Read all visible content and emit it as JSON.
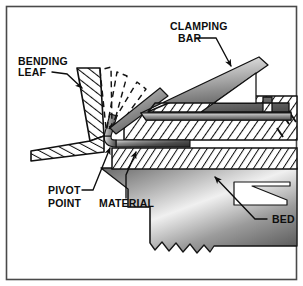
{
  "figure": {
    "frame_color": "#4a4a4a",
    "background_color": "#ffffff",
    "line_color": "#101010",
    "hatch_color": "#101010",
    "metal_light": "#f2f2f2",
    "metal_mid": "#9a9a9a",
    "metal_dark": "#4c4c4c"
  },
  "labels": {
    "bending_leaf": {
      "line1": "BENDING",
      "line2": "LEAF"
    },
    "clamping_bar": {
      "line1": "CLAMPING",
      "line2": "BAR"
    },
    "pivot_point": {
      "line1": "PIVOT",
      "line2": "POINT"
    },
    "material": {
      "line1": "MATERIAL"
    },
    "bed": {
      "line1": "BED"
    }
  },
  "parts": [
    {
      "id": "bending-leaf",
      "label": "BENDING LEAF",
      "style": "cross-hatched"
    },
    {
      "id": "clamping-bar",
      "label": "CLAMPING BAR",
      "style": "gradient-truss"
    },
    {
      "id": "clamping-block",
      "label": "clamping block",
      "style": "cross-hatched"
    },
    {
      "id": "bed-block",
      "label": "bed block",
      "style": "cross-hatched"
    },
    {
      "id": "bed-casting",
      "label": "BED",
      "style": "gradient-casting"
    },
    {
      "id": "material",
      "label": "MATERIAL",
      "style": "gradient-strip"
    },
    {
      "id": "pivot-point",
      "label": "PIVOT POINT",
      "style": "radius-bend"
    },
    {
      "id": "motion-arcs",
      "label": "bend travel positions",
      "style": "dashed-outline",
      "count": 3
    }
  ]
}
